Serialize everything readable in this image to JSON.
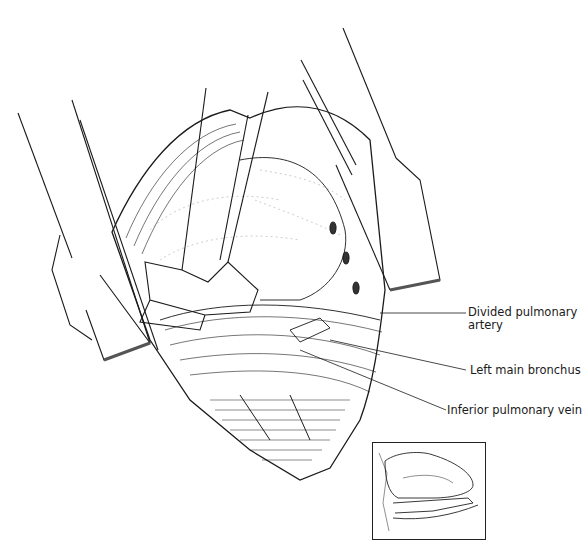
{
  "figure": {
    "labels": [
      {
        "id": "divided-pulmonary-artery",
        "text_line1": "Divided pulmonary",
        "text_line2": "artery"
      },
      {
        "id": "left-main-bronchus",
        "text": "Left main bronchus"
      },
      {
        "id": "inferior-pulmonary-vein",
        "text": "Inferior pulmonary vein"
      }
    ],
    "inset": {
      "description": "Orientation sketch of lung and hilum"
    },
    "colors": {
      "ink": "#1a1a1a",
      "background": "#ffffff"
    }
  }
}
